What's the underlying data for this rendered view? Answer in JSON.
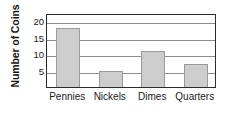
{
  "chart_data": {
    "type": "bar",
    "title": "",
    "xlabel": "",
    "ylabel": "Number of Coins",
    "categories": [
      "Pennies",
      "Nickels",
      "Dimes",
      "Quarters"
    ],
    "values": [
      18,
      5,
      11,
      7
    ],
    "ylim": [
      0,
      22.5
    ],
    "yticks": [
      5,
      10,
      15,
      20
    ],
    "ytick_labels": [
      "5",
      "10",
      "15",
      "20"
    ],
    "grid": "horizontal",
    "legend": "none",
    "series": [
      {
        "name": "Number of Coins",
        "values": [
          18,
          5,
          11,
          7
        ]
      }
    ],
    "colors": {
      "bar_fill": "#cdcdcd",
      "bar_border": "#9a9a9a",
      "gridline": "#8d8d8d",
      "frame": "#2b2b2b",
      "text": "#1a1a1a",
      "background": "#ffffff"
    }
  }
}
